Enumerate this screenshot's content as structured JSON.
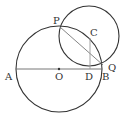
{
  "diagram": {
    "type": "geometry",
    "points": [
      {
        "label": "A",
        "x": 16,
        "y": 69
      },
      {
        "label": "O",
        "x": 59,
        "y": 69
      },
      {
        "label": "D",
        "x": 90,
        "y": 69
      },
      {
        "label": "B",
        "x": 102,
        "y": 69
      },
      {
        "label": "P",
        "x": 60,
        "y": 27
      },
      {
        "label": "C",
        "x": 90,
        "y": 38
      },
      {
        "label": "Q",
        "x": 103,
        "y": 64
      }
    ],
    "labels": {
      "A": "A",
      "O": "O",
      "D": "D",
      "B": "B",
      "P": "P",
      "C": "C",
      "Q": "Q"
    },
    "circles": [
      {
        "name": "circle-O",
        "cx": 59,
        "cy": 69,
        "r": 43
      },
      {
        "name": "circle-C",
        "cx": 89,
        "cy": 36,
        "r": 30
      }
    ],
    "segments": [
      {
        "from": "A",
        "to": "B"
      },
      {
        "from": "P",
        "to": "Q"
      },
      {
        "from": "C",
        "to": "D"
      }
    ],
    "colors": {
      "stroke": "#333333",
      "light_stroke": "#888888"
    }
  }
}
